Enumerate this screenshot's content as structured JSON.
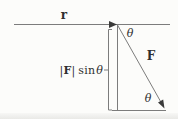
{
  "figure": {
    "colors": {
      "background": "#fcfcfa",
      "line": "#7c7c7c",
      "ink": "#2e2e2e"
    },
    "labels": {
      "lever_arm": "r",
      "force": "F",
      "angle_top": "θ",
      "angle_bottom": "θ",
      "component": {
        "bar_left": "|",
        "force_symbol": "F",
        "bar_right": "|",
        "function": "sin",
        "angle": "θ"
      }
    }
  }
}
